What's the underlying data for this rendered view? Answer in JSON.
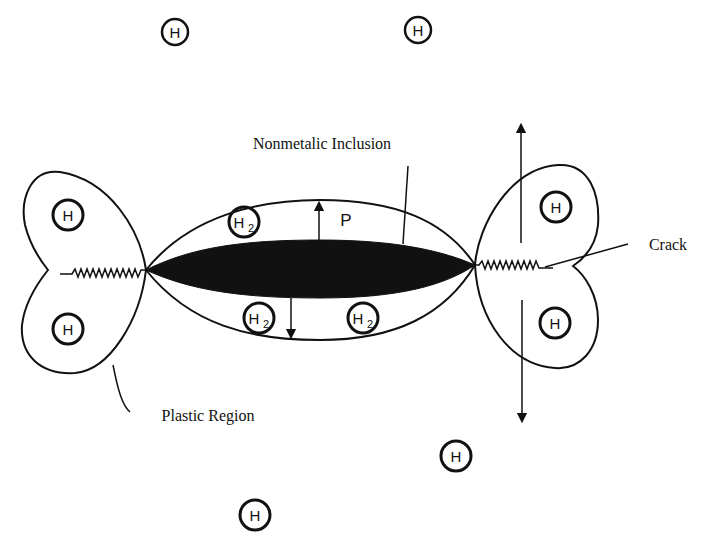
{
  "diagram": {
    "labels": {
      "inclusion": "Nonmetalic Inclusion",
      "crack": "Crack",
      "plastic_region": "Plastic Region",
      "pressure": "P"
    },
    "atoms": {
      "h": "H",
      "h2_main": "H",
      "h2_sub": "2"
    },
    "colors": {
      "ink": "#111111",
      "background": "#ffffff"
    },
    "free_hydrogen_count": 4,
    "plastic_zone_hydrogen_count": 4,
    "molecular_hydrogen_count": 3
  }
}
